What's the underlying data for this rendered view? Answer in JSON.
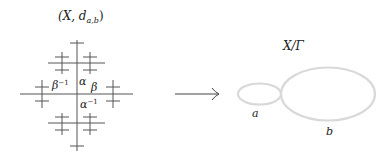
{
  "left_figure": {
    "title_prefix": "(X, d",
    "title_sub": "a,b",
    "title_suffix": ")",
    "labels": {
      "beta_inv": "β",
      "beta_inv_sup": "−1",
      "alpha": "α",
      "beta": "β",
      "alpha_inv": "α",
      "alpha_inv_sup": "−1"
    },
    "stroke_color": "#555555"
  },
  "arrow": {
    "stroke_color": "#444444"
  },
  "right_figure": {
    "title": "X/Γ",
    "loop_a_label": "a",
    "loop_b_label": "b",
    "loop_color": "#d9d9d9"
  }
}
